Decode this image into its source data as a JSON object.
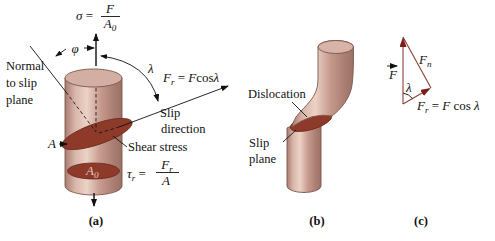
{
  "panel_a": {
    "caption": "(a)",
    "sigma": {
      "symbol": "σ",
      "eq": " = ",
      "num": "F",
      "den": "A",
      "den_sub": "0"
    },
    "normal1": "Normal",
    "normal2": "to slip",
    "normal3": "plane",
    "phi": "φ",
    "lambda": "λ",
    "fr": {
      "f": "F",
      "sub": "r",
      "eq": " = ",
      "rf": "F",
      "cos": "cos",
      "lam": "λ"
    },
    "slip1": "Slip",
    "slip2": "direction",
    "shear": "Shear stress",
    "tau": {
      "t": "τ",
      "sub": "r",
      "eq": " = ",
      "num": "F",
      "num_sub": "r",
      "den": "A"
    },
    "a_label": "A",
    "a0": {
      "base": "A",
      "sub": "0"
    }
  },
  "panel_b": {
    "caption": "(b)",
    "dislocation": "Dislocation",
    "slip1": "Slip",
    "slip2": "plane"
  },
  "panel_c": {
    "caption": "(c)",
    "f": "F",
    "fn": {
      "base": "F",
      "sub": "n"
    },
    "lambda": "λ",
    "fr": {
      "f": "F",
      "sub": "r",
      "eq": " = ",
      "rf": "F",
      "cos": " cos ",
      "lam": "λ"
    }
  },
  "colors": {
    "cylinder_mid": "#c79a8e",
    "cylinder_highlight": "#ecd2c6",
    "slip_face": "#8e3a2a",
    "vector_line": "#8a4038",
    "vector_arrow": "#7b1f17",
    "text": "#111111",
    "background": "#ffffff"
  }
}
